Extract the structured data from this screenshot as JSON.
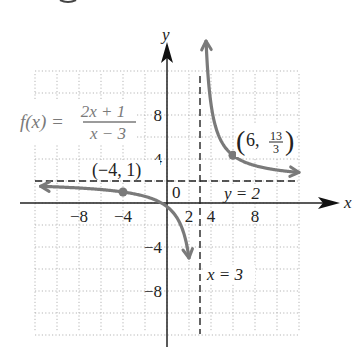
{
  "chart_data": {
    "type": "line",
    "title": "",
    "function": {
      "label_lhs": "f(x) =",
      "numerator": "2x + 1",
      "denominator": "x − 3",
      "expression": "(2x+1)/(x-3)"
    },
    "xlabel": "x",
    "ylabel": "y",
    "xlim": [
      -12,
      12
    ],
    "ylim": [
      -12,
      12
    ],
    "grid": true,
    "grid_step": 2,
    "x_ticks": [
      {
        "value": -8,
        "label": "−8"
      },
      {
        "value": -4,
        "label": "−4"
      },
      {
        "value": 2,
        "label": "2"
      },
      {
        "value": 4,
        "label": "4"
      },
      {
        "value": 8,
        "label": "8"
      }
    ],
    "y_ticks": [
      {
        "value": 8,
        "label": "8"
      },
      {
        "value": 4,
        "label": "4"
      },
      {
        "value": -4,
        "label": "−4"
      },
      {
        "value": -8,
        "label": "−8"
      }
    ],
    "origin_label": "0",
    "asymptotes": [
      {
        "type": "vertical",
        "value": 3,
        "label": "x = 3"
      },
      {
        "type": "horizontal",
        "value": 2,
        "label": "y = 2"
      }
    ],
    "points": [
      {
        "x": -4,
        "y": 1,
        "label": "(−4, 1)"
      },
      {
        "x": 6,
        "y": 4.333,
        "label_prefix": "(6, ",
        "label_num": "13",
        "label_den": "3",
        "label_suffix": ")"
      }
    ],
    "series": [
      {
        "name": "left branch",
        "x_range": [
          -11.5,
          2.0
        ]
      },
      {
        "name": "right branch",
        "x_range": [
          3.55,
          12.0
        ]
      }
    ],
    "colors": {
      "curve": "#7a7a7a",
      "grid": "#b5b5b5",
      "axis": "#222222",
      "asymptote": "#222222"
    }
  }
}
